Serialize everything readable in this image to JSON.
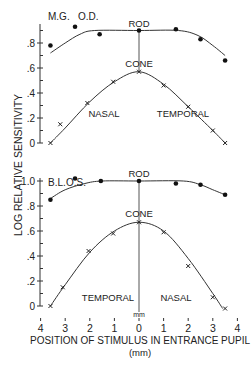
{
  "figure": {
    "ylabel": "LOG  RELATIVE  SENSITIVITY",
    "xlabel": "POSITION  OF STIMULUS IN  ENTRANCE PUPIL",
    "xunit": "(mm)",
    "zero_unit": "mm",
    "xticks": [
      "4",
      "3",
      "2",
      "1",
      "0",
      "1",
      "2",
      "3",
      "4"
    ]
  },
  "panels": [
    {
      "subject": "M.G.",
      "eye": "O.D.",
      "rod_label": "ROD",
      "cone_label": "CONE",
      "left_region": "NASAL",
      "right_region": "TEMPORAL",
      "yticks": [
        ".8",
        ".6",
        ".4",
        ".2",
        "0"
      ]
    },
    {
      "subject": "B.L.",
      "eye": "O.S.",
      "rod_label": "ROD",
      "cone_label": "CONE",
      "left_region": "TEMPORAL",
      "right_region": "NASAL",
      "yticks": [
        "1.0",
        ".8",
        ".6",
        ".4",
        ".2",
        "0"
      ]
    }
  ],
  "chart_data": [
    {
      "type": "line",
      "title": "M.G. O.D.",
      "xlabel": "Position of stimulus in entrance pupil (mm)",
      "ylabel": "Log relative sensitivity",
      "xlim": [
        -4,
        4
      ],
      "ylim": [
        0,
        0.9
      ],
      "x_direction_labels": {
        "left": "NASAL",
        "right": "TEMPORAL"
      },
      "series": [
        {
          "name": "ROD",
          "marker": "dot",
          "points": [
            [
              -3.6,
              0.78
            ],
            [
              -2.6,
              0.93
            ],
            [
              -1.6,
              0.87
            ],
            [
              0,
              0.9
            ],
            [
              1.5,
              0.91
            ],
            [
              2.5,
              0.83
            ],
            [
              3.5,
              0.66
            ]
          ],
          "fit": [
            [
              -3.6,
              0.72
            ],
            [
              -3.0,
              0.8
            ],
            [
              -2.4,
              0.87
            ],
            [
              -1.8,
              0.9
            ],
            [
              0,
              0.9
            ],
            [
              1.6,
              0.9
            ],
            [
              2.4,
              0.86
            ],
            [
              3.0,
              0.78
            ],
            [
              3.5,
              0.7
            ]
          ]
        },
        {
          "name": "CONE",
          "marker": "x",
          "points": [
            [
              -3.6,
              0.0
            ],
            [
              -3.2,
              0.15
            ],
            [
              -2.1,
              0.32
            ],
            [
              -1.05,
              0.49
            ],
            [
              0,
              0.57
            ],
            [
              1.0,
              0.46
            ],
            [
              2.0,
              0.29
            ],
            [
              3.0,
              0.1
            ],
            [
              3.5,
              0.0
            ]
          ],
          "fit": [
            [
              -3.6,
              0.0
            ],
            [
              -3.0,
              0.12
            ],
            [
              -2.0,
              0.33
            ],
            [
              -1.0,
              0.49
            ],
            [
              0,
              0.57
            ],
            [
              1.0,
              0.47
            ],
            [
              2.0,
              0.29
            ],
            [
              3.0,
              0.1
            ],
            [
              3.5,
              0.0
            ]
          ]
        }
      ]
    },
    {
      "type": "line",
      "title": "B.L. O.S.",
      "xlabel": "Position of stimulus in entrance pupil (mm)",
      "ylabel": "Log relative sensitivity",
      "xlim": [
        -4,
        4
      ],
      "ylim": [
        0,
        1.0
      ],
      "x_direction_labels": {
        "left": "TEMPORAL",
        "right": "NASAL"
      },
      "series": [
        {
          "name": "ROD",
          "marker": "dot",
          "points": [
            [
              -3.6,
              0.85
            ],
            [
              -2.6,
              1.02
            ],
            [
              -1.55,
              1.0
            ],
            [
              0,
              1.0
            ],
            [
              1.5,
              0.98
            ],
            [
              2.5,
              0.97
            ],
            [
              3.5,
              0.89
            ]
          ],
          "fit": [
            [
              -3.6,
              0.86
            ],
            [
              -3.0,
              0.93
            ],
            [
              -2.2,
              0.98
            ],
            [
              -1.5,
              1.0
            ],
            [
              0,
              1.0
            ],
            [
              1.8,
              1.0
            ],
            [
              2.5,
              0.97
            ],
            [
              3.0,
              0.93
            ],
            [
              3.5,
              0.89
            ]
          ]
        },
        {
          "name": "CONE",
          "marker": "x",
          "points": [
            [
              -3.6,
              0.0
            ],
            [
              -3.1,
              0.15
            ],
            [
              -2.05,
              0.44
            ],
            [
              -1.05,
              0.58
            ],
            [
              0,
              0.67
            ],
            [
              1.0,
              0.59
            ],
            [
              2.0,
              0.32
            ],
            [
              3.0,
              0.07
            ],
            [
              3.5,
              -0.02
            ]
          ],
          "fit": [
            [
              -3.6,
              0.0
            ],
            [
              -3.0,
              0.17
            ],
            [
              -2.0,
              0.43
            ],
            [
              -1.0,
              0.6
            ],
            [
              0,
              0.67
            ],
            [
              1.0,
              0.6
            ],
            [
              2.0,
              0.38
            ],
            [
              3.0,
              0.1
            ],
            [
              3.4,
              -0.02
            ]
          ]
        }
      ]
    }
  ]
}
